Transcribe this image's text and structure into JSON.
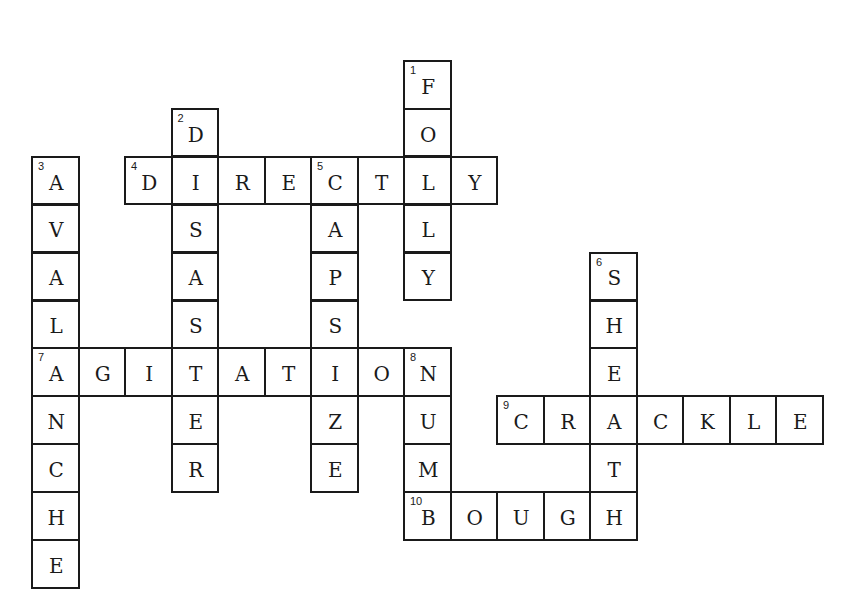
{
  "puzzle": {
    "type": "crossword",
    "grid_origin": {
      "x": 31,
      "y": 60
    },
    "cell_size": {
      "w": 46.5,
      "h": 47.9
    },
    "colors": {
      "border": "#1a1a1a",
      "background": "#ffffff",
      "text": "#1a1a1a"
    },
    "words": [
      {
        "number": 1,
        "direction": "down",
        "answer": "FOLLY",
        "row": 0,
        "col": 8
      },
      {
        "number": 2,
        "direction": "down",
        "answer": "DISASTER",
        "row": 1,
        "col": 3
      },
      {
        "number": 3,
        "direction": "down",
        "answer": "AVALANCHE",
        "row": 2,
        "col": 0
      },
      {
        "number": 4,
        "direction": "across",
        "answer": "DIRECTLY",
        "row": 2,
        "col": 2
      },
      {
        "number": 5,
        "direction": "down",
        "answer": "CAPSIZE",
        "row": 2,
        "col": 6
      },
      {
        "number": 6,
        "direction": "down",
        "answer": "SHEATH",
        "row": 4,
        "col": 12
      },
      {
        "number": 7,
        "direction": "across",
        "answer": "AGITATION",
        "row": 6,
        "col": 0
      },
      {
        "number": 8,
        "direction": "down",
        "answer": "NUMB",
        "row": 6,
        "col": 8
      },
      {
        "number": 9,
        "direction": "across",
        "answer": "CRACKLE",
        "row": 7,
        "col": 10
      },
      {
        "number": 10,
        "direction": "across",
        "answer": "BOUGH",
        "row": 9,
        "col": 8
      }
    ]
  }
}
